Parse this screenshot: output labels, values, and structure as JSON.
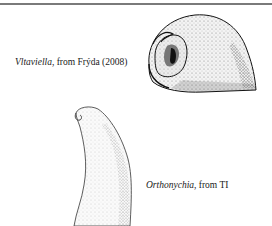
{
  "figure": {
    "panels": [
      {
        "taxon": "Vltaviella",
        "source": ", from Frýda (2008)",
        "illustration": "coiled-gastropod-shell-drawing"
      },
      {
        "taxon": "Orthonychia",
        "source": ", from TI",
        "illustration": "cap-shaped-shell-drawing"
      }
    ]
  }
}
